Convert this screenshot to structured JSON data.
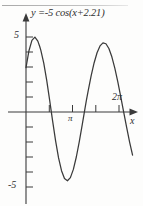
{
  "figure": {
    "title": "y =-5 cos(x+2.21)",
    "axis_x_name": "x",
    "y_tick_top": "5",
    "y_tick_bottom": "-5",
    "x_tick_pi": "π",
    "x_tick_2pi": "2π",
    "stroke_color": "#3a3a3a",
    "background_color": "#fdfdfc"
  },
  "chart_data": {
    "type": "line",
    "title": "y =-5 cos(x+2.21)",
    "xlabel": "x",
    "ylabel": "y",
    "xlim": [
      -0.55,
      7.6
    ],
    "ylim": [
      -6.4,
      6.2
    ],
    "xticks": [
      0,
      1.5708,
      3.1416,
      4.7124,
      6.2832
    ],
    "xticklabels": [
      "",
      "",
      "π",
      "",
      "2π"
    ],
    "yticks": [
      -5,
      -4,
      -3,
      -2,
      -1,
      0,
      1,
      2,
      3,
      4,
      5
    ],
    "yticklabels": [
      "-5",
      "",
      "",
      "",
      "",
      "",
      "",
      "",
      "",
      "",
      "5"
    ],
    "grid": false,
    "legend": false,
    "equation": "y = -5*cos(x + 2.21)",
    "amplitude": -5,
    "phase_shift": 2.21,
    "period": 6.2832,
    "series": [
      {
        "name": "y =-5 cos(x+2.21)",
        "x": [
          0,
          0.2,
          0.4,
          0.6,
          0.8,
          0.9316,
          1.0,
          1.2,
          1.4,
          1.6,
          1.8,
          2.0,
          2.2,
          2.4,
          2.6,
          2.8,
          3.0,
          3.2,
          3.4,
          3.6,
          3.8,
          4.0,
          4.0732,
          4.2,
          4.4,
          4.6,
          4.8,
          5.0,
          5.2,
          5.4,
          5.6,
          5.8,
          6.0,
          6.2,
          6.4,
          6.6,
          6.8,
          7.0,
          7.2
        ],
        "y": [
          2.958,
          4.086,
          4.779,
          4.996,
          4.723,
          4.353,
          4.128,
          3.262,
          2.105,
          0.772,
          -0.613,
          -1.928,
          -3.059,
          -3.914,
          -4.432,
          -4.586,
          -4.373,
          -3.826,
          -3.0,
          -1.972,
          -0.836,
          0.324,
          0.738,
          1.41,
          2.403,
          3.268,
          3.95,
          4.407,
          4.611,
          4.551,
          4.233,
          3.679,
          2.925,
          2.022,
          1.026,
          -0.006,
          -1.032,
          -2.005,
          -2.881
        ]
      }
    ]
  }
}
